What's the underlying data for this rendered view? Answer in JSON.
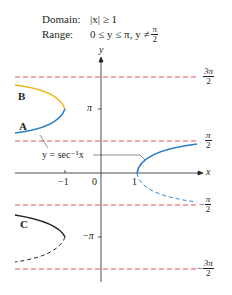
{
  "header": {
    "domain_label": "Domain:",
    "domain_value": "|x| ≥ 1",
    "range_label": "Range:",
    "range_value": "0 ≤ y ≤ π, y ≠",
    "range_frac_num": "π",
    "range_frac_den": "2"
  },
  "axes": {
    "x_label": "x",
    "y_label": "y",
    "x_ticks": [
      "−1",
      "0",
      "1"
    ],
    "y_tick_pi": "π",
    "y_tick_neg_pi": "−π"
  },
  "asymptotes": [
    {
      "num": "3π",
      "den": "2",
      "sign": ""
    },
    {
      "num": "π",
      "den": "2",
      "sign": ""
    },
    {
      "num": "π",
      "den": "2",
      "sign": "−"
    },
    {
      "num": "3π",
      "den": "2",
      "sign": "−"
    }
  ],
  "curve_labels": {
    "a": "A",
    "b": "B",
    "c": "C"
  },
  "function_label": "y = sec⁻¹x",
  "colors": {
    "asymptote": "#e0403a",
    "curve_blue": "#2a7fc9",
    "curve_yellow": "#f1b51c",
    "curve_black": "#231f20",
    "axis": "#231f20"
  }
}
